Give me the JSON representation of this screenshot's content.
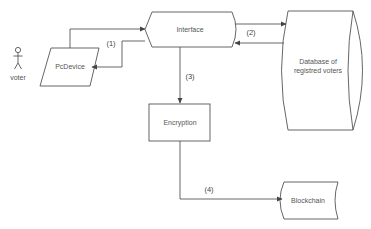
{
  "diagram": {
    "type": "flowchart",
    "nodes": {
      "voter": {
        "label": "voter",
        "shape": "actor"
      },
      "pc_device": {
        "label": "PcDevice",
        "shape": "parallelogram"
      },
      "interface": {
        "label": "Interface",
        "shape": "display"
      },
      "database": {
        "label_line1": "Database of",
        "label_line2": "registred voters",
        "shape": "stored-data"
      },
      "encryption": {
        "label": "Encryption",
        "shape": "rectangle"
      },
      "blockchain": {
        "label": "Blockchain",
        "shape": "stored-data"
      }
    },
    "edges": [
      {
        "id": "e1a",
        "from": "pc_device",
        "to": "interface",
        "label": ""
      },
      {
        "id": "e1b",
        "from": "interface",
        "to": "pc_device",
        "label": "(1)"
      },
      {
        "id": "e2a",
        "from": "interface",
        "to": "database",
        "label": ""
      },
      {
        "id": "e2b",
        "from": "database",
        "to": "interface",
        "label": "(2)"
      },
      {
        "id": "e3",
        "from": "interface",
        "to": "encryption",
        "label": "(3)"
      },
      {
        "id": "e4",
        "from": "encryption",
        "to": "blockchain",
        "label": "(4)"
      }
    ],
    "colors": {
      "stroke": "#555555",
      "text": "#555555",
      "background": "#ffffff"
    }
  }
}
